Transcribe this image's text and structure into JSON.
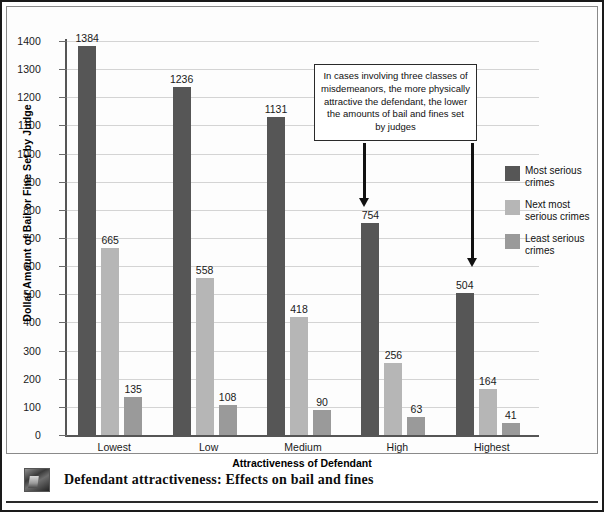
{
  "figure": {
    "caption": "Defendant attractiveness: Effects on bail and fines",
    "thumb_icon": "photo-thumbnail"
  },
  "annotation": {
    "text": "In cases involving three classes of misdemeanors, the more physically attractive the defendant, the lower the amounts of bail and fines set by judges"
  },
  "legend": {
    "items": [
      {
        "label": "Most serious crimes",
        "color": "#565656"
      },
      {
        "label": "Next most serious crimes",
        "color": "#b6b6b6"
      },
      {
        "label": "Least serious crimes",
        "color": "#9a9a9a"
      }
    ]
  },
  "chart_data": {
    "type": "bar",
    "title": "",
    "xlabel": "Attractiveness of Defendant",
    "ylabel": "Dollar Amount of Bail or Fine Set by Judge",
    "categories": [
      "Lowest",
      "Low",
      "Medium",
      "High",
      "Highest"
    ],
    "series": [
      {
        "name": "Most serious crimes",
        "color": "#565656",
        "values": [
          1384,
          1236,
          1131,
          754,
          504
        ]
      },
      {
        "name": "Next most serious crimes",
        "color": "#b6b6b6",
        "values": [
          665,
          558,
          418,
          256,
          164
        ]
      },
      {
        "name": "Least serious crimes",
        "color": "#9a9a9a",
        "values": [
          135,
          108,
          90,
          63,
          41
        ]
      }
    ],
    "ylim": [
      0,
      1400
    ],
    "ytick_labels": [
      "0",
      "100",
      "200",
      "300",
      "400",
      "500",
      "600",
      "700",
      "800",
      "900",
      "1000",
      "1100",
      "1200",
      "1300",
      "1400"
    ],
    "grid": true,
    "legend_position": "right"
  }
}
